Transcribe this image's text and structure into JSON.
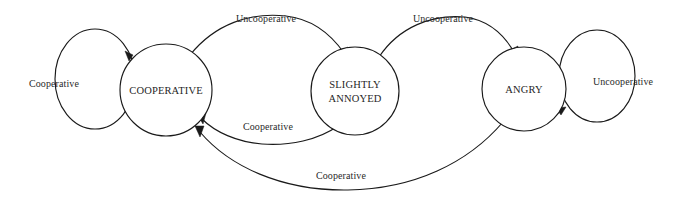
{
  "diagram": {
    "type": "state-transition-diagram",
    "background_color": "#ffffff",
    "stroke_color": "#1a1a1a",
    "text_color": "#1f1f1f",
    "states": [
      {
        "id": "cooperative",
        "label_line1": "COOPERATIVE",
        "label_line2": "",
        "cx": 166,
        "cy": 90,
        "rx": 46,
        "ry": 46
      },
      {
        "id": "slightly-annoyed",
        "label_line1": "SLIGHTLY",
        "label_line2": "ANNOYED",
        "cx": 355,
        "cy": 91,
        "rx": 44,
        "ry": 44
      },
      {
        "id": "angry",
        "label_line1": "ANGRY",
        "label_line2": "",
        "cx": 524,
        "cy": 89,
        "rx": 42,
        "ry": 42
      }
    ],
    "self_loops": [
      {
        "id": "cooperative-self-loop",
        "from": "cooperative",
        "to": "cooperative",
        "label": "Cooperative",
        "label_x": 54,
        "label_y": 87,
        "cx": 95,
        "cy": 79,
        "rx": 40,
        "ry": 50
      },
      {
        "id": "angry-self-loop",
        "from": "angry",
        "to": "angry",
        "label": "Uncooperative",
        "label_x": 623,
        "label_y": 85,
        "cx": 597,
        "cy": 76,
        "rx": 38,
        "ry": 46
      }
    ],
    "transitions": [
      {
        "id": "cooperative-to-slightly-annoyed",
        "from": "cooperative",
        "to": "slightly-annoyed",
        "label": "Uncooperative",
        "label_x": 266,
        "label_y": 22,
        "direction": "forward"
      },
      {
        "id": "slightly-annoyed-to-angry",
        "from": "slightly-annoyed",
        "to": "angry",
        "label": "Uncooperative",
        "label_x": 443,
        "label_y": 22,
        "direction": "forward"
      },
      {
        "id": "slightly-annoyed-to-cooperative",
        "from": "slightly-annoyed",
        "to": "cooperative",
        "label": "Cooperative",
        "label_x": 268,
        "label_y": 130,
        "direction": "backward"
      },
      {
        "id": "angry-to-cooperative",
        "from": "angry",
        "to": "cooperative",
        "label": "Cooperative",
        "label_x": 341,
        "label_y": 179,
        "direction": "backward"
      }
    ]
  }
}
